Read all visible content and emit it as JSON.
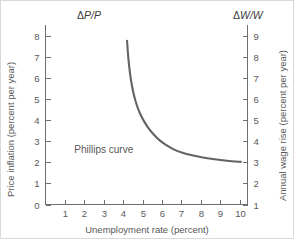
{
  "chart_data": {
    "type": "line",
    "title": "",
    "subtitle": "",
    "xlabel": "Unemployment rate (percent)",
    "ylabel": "Price inflation (percent per year)",
    "y2label": "Annual wage rise (percent per year)",
    "y_symbol_delta": "Δ",
    "y_symbol_numerator": "P",
    "y_symbol_separator": "/",
    "y_symbol_denominator": "P",
    "y2_symbol_delta": "Δ",
    "y2_symbol_numerator": "W",
    "y2_symbol_separator": "/",
    "y2_symbol_denominator": "W",
    "grid": false,
    "legend": "none",
    "xlim": [
      0,
      10.4
    ],
    "ylim": [
      0,
      8.5
    ],
    "y2lim": [
      1,
      9.5
    ],
    "xticks": [
      1,
      2,
      3,
      4,
      5,
      6,
      7,
      8,
      9,
      10
    ],
    "xticklabels": [
      "1",
      "2",
      "3",
      "4",
      "5",
      "6",
      "7",
      "8",
      "9",
      "10"
    ],
    "yticks": [
      0,
      1,
      2,
      3,
      4,
      5,
      6,
      7,
      8
    ],
    "yticklabels": [
      "0",
      "1",
      "2",
      "3",
      "4",
      "5",
      "6",
      "7",
      "8"
    ],
    "y2ticks": [
      1,
      2,
      3,
      4,
      5,
      6,
      7,
      8,
      9
    ],
    "y2ticklabels": [
      "1",
      "2",
      "3",
      "4",
      "5",
      "6",
      "7",
      "8",
      "9"
    ],
    "annotations": [
      {
        "text": "Phillips curve",
        "x": 3.0,
        "y": 2.45
      }
    ],
    "series": [
      {
        "name": "Phillips curve",
        "color": "#636363",
        "x": [
          4.2,
          4.25,
          4.32,
          4.4,
          4.5,
          4.62,
          4.76,
          4.92,
          5.1,
          5.3,
          5.55,
          5.85,
          6.2,
          6.6,
          7.05,
          7.55,
          8.1,
          8.7,
          9.35,
          10.05
        ],
        "y": [
          7.75,
          7.1,
          6.45,
          5.9,
          5.4,
          4.95,
          4.55,
          4.2,
          3.9,
          3.62,
          3.34,
          3.06,
          2.82,
          2.61,
          2.45,
          2.33,
          2.23,
          2.14,
          2.07,
          2.02
        ]
      }
    ]
  }
}
